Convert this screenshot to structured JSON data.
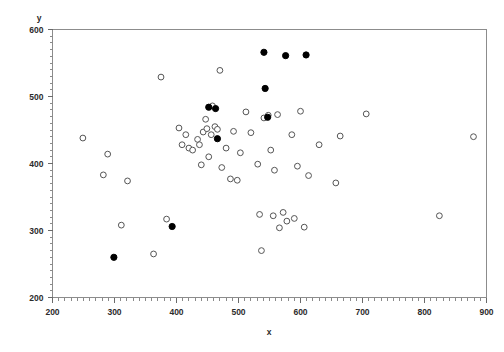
{
  "chart_data": {
    "type": "scatter",
    "title": "",
    "xlabel": "x",
    "ylabel": "y",
    "xlim": [
      200,
      900
    ],
    "ylim": [
      200,
      600
    ],
    "xticks": [
      200,
      300,
      400,
      500,
      600,
      700,
      800,
      900
    ],
    "yticks": [
      200,
      300,
      400,
      500,
      600
    ],
    "xtick_labels": [
      "200",
      "300",
      "400",
      "500",
      "600",
      "700",
      "800",
      "900"
    ],
    "ytick_labels": [
      "200",
      "300",
      "400",
      "500",
      "600"
    ],
    "minor_ticks_per_interval": 10,
    "grid": false,
    "legend": "none",
    "series": [
      {
        "name": "open",
        "marker": "open-circle",
        "color": "#555555",
        "points": [
          [
            249,
            438
          ],
          [
            282,
            383
          ],
          [
            289,
            414
          ],
          [
            311,
            308
          ],
          [
            321,
            374
          ],
          [
            363,
            265
          ],
          [
            375,
            529
          ],
          [
            384,
            317
          ],
          [
            404,
            453
          ],
          [
            409,
            428
          ],
          [
            415,
            443
          ],
          [
            420,
            423
          ],
          [
            426,
            420
          ],
          [
            434,
            436
          ],
          [
            437,
            428
          ],
          [
            440,
            398
          ],
          [
            443,
            447
          ],
          [
            447,
            466
          ],
          [
            449,
            452
          ],
          [
            452,
            410
          ],
          [
            456,
            443
          ],
          [
            458,
            486
          ],
          [
            462,
            455
          ],
          [
            466,
            451
          ],
          [
            470,
            539
          ],
          [
            473,
            394
          ],
          [
            480,
            423
          ],
          [
            487,
            377
          ],
          [
            492,
            448
          ],
          [
            498,
            375
          ],
          [
            503,
            416
          ],
          [
            512,
            477
          ],
          [
            520,
            446
          ],
          [
            531,
            399
          ],
          [
            534,
            324
          ],
          [
            537,
            270
          ],
          [
            541,
            468
          ],
          [
            548,
            472
          ],
          [
            552,
            420
          ],
          [
            556,
            322
          ],
          [
            558,
            390
          ],
          [
            563,
            473
          ],
          [
            566,
            304
          ],
          [
            572,
            327
          ],
          [
            578,
            314
          ],
          [
            586,
            443
          ],
          [
            590,
            318
          ],
          [
            595,
            396
          ],
          [
            600,
            478
          ],
          [
            606,
            305
          ],
          [
            613,
            382
          ],
          [
            630,
            428
          ],
          [
            657,
            371
          ],
          [
            664,
            441
          ],
          [
            706,
            474
          ],
          [
            824,
            322
          ],
          [
            879,
            440
          ]
        ]
      },
      {
        "name": "filled",
        "marker": "filled-circle",
        "color": "#000000",
        "points": [
          [
            299,
            260
          ],
          [
            393,
            306
          ],
          [
            452,
            484
          ],
          [
            463,
            482
          ],
          [
            466,
            437
          ],
          [
            541,
            566
          ],
          [
            543,
            512
          ],
          [
            547,
            469
          ],
          [
            576,
            561
          ],
          [
            609,
            562
          ]
        ]
      }
    ]
  },
  "axes": {
    "y_axis_title": "y",
    "x_axis_title": "x"
  }
}
